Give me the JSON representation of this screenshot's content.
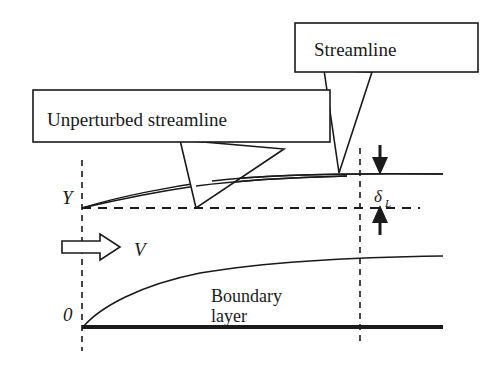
{
  "figure": {
    "type": "technical-diagram",
    "background_color": "#ffffff",
    "line_color": "#1a1a1a",
    "width": 502,
    "height": 365
  },
  "callouts": [
    {
      "id": "streamline",
      "label": "Streamline",
      "box": {
        "x": 295,
        "y": 23,
        "w": 183,
        "h": 49
      },
      "text_x": 314,
      "text_y": 55,
      "pointer_tip": {
        "x": 339,
        "y": 173
      }
    },
    {
      "id": "unperturbed-streamline",
      "label": "Unperturbed streamline",
      "box": {
        "x": 33,
        "y": 90,
        "w": 297,
        "h": 52
      },
      "text_x": 47,
      "text_y": 125,
      "pointer_tip": {
        "x": 196,
        "y": 208
      }
    }
  ],
  "labels": {
    "y_axis": "Y",
    "origin": "0",
    "velocity": "V",
    "delta": "δ",
    "delta_subscript": "L",
    "boundary_line1": "Boundary",
    "boundary_line2": "layer"
  },
  "label_positions": {
    "y_axis": {
      "x": 62,
      "y": 203
    },
    "origin": {
      "x": 64,
      "y": 319
    },
    "velocity": {
      "x": 135,
      "y": 255
    },
    "delta": {
      "x": 376,
      "y": 201
    },
    "delta_subscript": {
      "x": 387,
      "y": 206
    },
    "boundary_line1": {
      "x": 213,
      "y": 300
    },
    "boundary_line2": {
      "x": 213,
      "y": 320
    }
  },
  "geometry": {
    "left_dashed_vertical": {
      "x": 82,
      "y1": 160,
      "y2": 351
    },
    "right_dashed_vertical": {
      "x": 360,
      "y1": 148,
      "y2": 345
    },
    "horizontal_dashed_Y": {
      "y": 208,
      "x1": 82,
      "x2": 420
    },
    "wall_line": {
      "y": 327,
      "x1": 82,
      "x2": 443,
      "width": 4
    },
    "perturbed_streamline": "M 82 208 C 120 196 175 186 210 181 C 270 175 360 173 443 174",
    "unperturbed_streamline_curve": "M 82 208 C 118 200 160 191 196 186 C 250 179 300 177 345 176",
    "boundary_layer_curve": "M 83 327 C 110 300 150 281 200 272 C 270 262 360 258 443 257",
    "arrow_down": {
      "x": 380,
      "y_top": 145,
      "y_bottom": 173
    },
    "arrow_up": {
      "x": 380,
      "y_top": 205,
      "y_bottom": 234
    },
    "velocity_arrow": {
      "x1": 62,
      "x2": 119,
      "y": 247
    }
  }
}
